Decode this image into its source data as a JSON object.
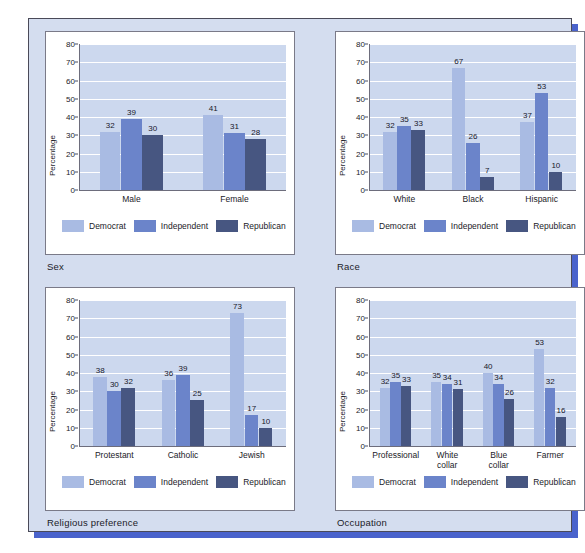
{
  "series_colors": {
    "Democrat": "#a9bbe3",
    "Independent": "#6b84ca",
    "Republican": "#475681"
  },
  "legend": {
    "democrat": "Democrat",
    "independent": "Independent",
    "republican": "Republican"
  },
  "axis": {
    "ylabel": "Percentage",
    "ticks": [
      "80",
      "70",
      "60",
      "50",
      "40",
      "30",
      "20",
      "10",
      "0"
    ]
  },
  "panels": {
    "sex": {
      "caption": "Sex"
    },
    "race": {
      "caption": "Race"
    },
    "religion": {
      "caption": "Religious preference"
    },
    "occupation": {
      "caption": "Occupation"
    }
  },
  "chart_data": [
    {
      "type": "bar",
      "title": "Sex",
      "xlabel": "",
      "ylabel": "Percentage",
      "ylim": [
        0,
        80
      ],
      "grid": true,
      "legend_position": "bottom",
      "categories": [
        "Male",
        "Female"
      ],
      "series": [
        {
          "name": "Democrat",
          "values": [
            32,
            41
          ]
        },
        {
          "name": "Independent",
          "values": [
            39,
            31
          ]
        },
        {
          "name": "Republican",
          "values": [
            30,
            28
          ]
        }
      ]
    },
    {
      "type": "bar",
      "title": "Race",
      "xlabel": "",
      "ylabel": "Percentage",
      "ylim": [
        0,
        80
      ],
      "grid": true,
      "legend_position": "bottom",
      "categories": [
        "White",
        "Black",
        "Hispanic"
      ],
      "series": [
        {
          "name": "Democrat",
          "values": [
            32,
            67,
            37
          ]
        },
        {
          "name": "Independent",
          "values": [
            35,
            26,
            53
          ]
        },
        {
          "name": "Republican",
          "values": [
            33,
            7,
            10
          ]
        }
      ]
    },
    {
      "type": "bar",
      "title": "Religious preference",
      "xlabel": "",
      "ylabel": "Percentage",
      "ylim": [
        0,
        80
      ],
      "grid": true,
      "legend_position": "bottom",
      "categories": [
        "Protestant",
        "Catholic",
        "Jewish"
      ],
      "series": [
        {
          "name": "Democrat",
          "values": [
            38,
            36,
            73
          ]
        },
        {
          "name": "Independent",
          "values": [
            30,
            39,
            17
          ]
        },
        {
          "name": "Republican",
          "values": [
            32,
            25,
            10
          ]
        }
      ]
    },
    {
      "type": "bar",
      "title": "Occupation",
      "xlabel": "",
      "ylabel": "Percentage",
      "ylim": [
        0,
        80
      ],
      "grid": true,
      "legend_position": "bottom",
      "categories": [
        "Professional",
        "White collar",
        "Blue collar",
        "Farmer"
      ],
      "category_lines": [
        [
          "Professional"
        ],
        [
          "White",
          "collar"
        ],
        [
          "Blue",
          "collar"
        ],
        [
          "Farmer"
        ]
      ],
      "series": [
        {
          "name": "Democrat",
          "values": [
            32,
            35,
            40,
            53
          ]
        },
        {
          "name": "Independent",
          "values": [
            35,
            34,
            34,
            32
          ]
        },
        {
          "name": "Republican",
          "values": [
            33,
            31,
            26,
            16
          ]
        }
      ]
    }
  ]
}
